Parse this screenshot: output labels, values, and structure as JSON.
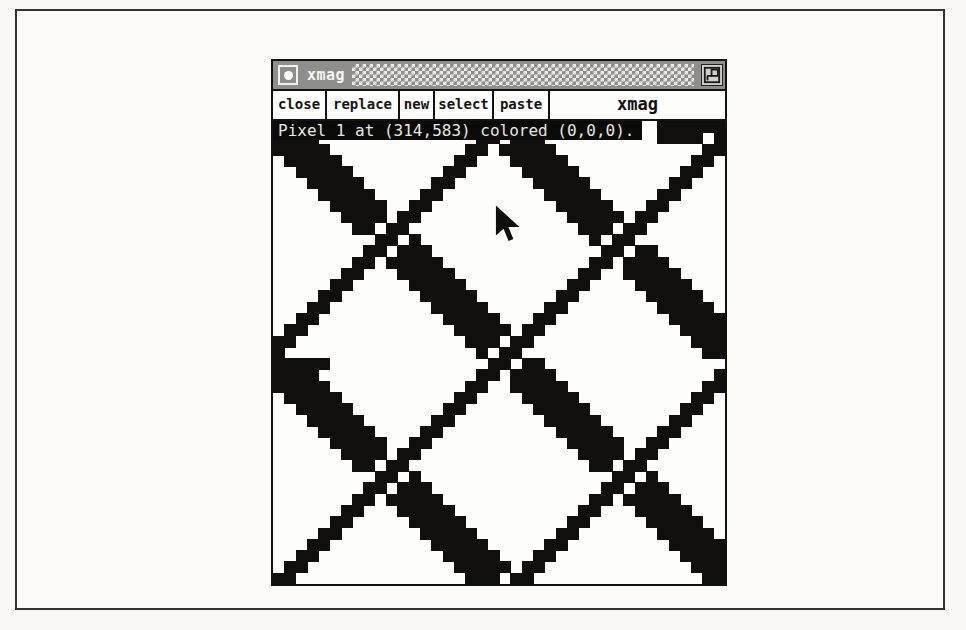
{
  "window": {
    "titlebar": {
      "title": "xmag",
      "bar_color": "#8e8e8c"
    },
    "toolbar": {
      "buttons": [
        "close",
        "replace",
        "new",
        "select",
        "paste"
      ],
      "app_label": "xmag"
    },
    "status": {
      "text": "Pixel 1 at (314,583) colored (0,0,0).",
      "fg": "#e7e6e2",
      "bg": "#0a0a09"
    }
  },
  "magnifier": {
    "pattern": "magnified-black-and-white-weave-bitmap",
    "grid_cols": 40,
    "grid_rows": 41,
    "thick_diagonals_i_minus_j": [
      -21,
      0,
      20,
      40
    ],
    "thick_halfwidth": 2.2,
    "thin_diagonals_i_plus_j": [
      20,
      41,
      62
    ],
    "edge_bars": [
      [
        0,
        34,
        39
      ],
      [
        1,
        34,
        37
      ],
      [
        21,
        0,
        4
      ]
    ],
    "ink": "#100f0e",
    "paper": "#fdfdfb",
    "cursor": {
      "x": 222,
      "y": 84
    }
  }
}
